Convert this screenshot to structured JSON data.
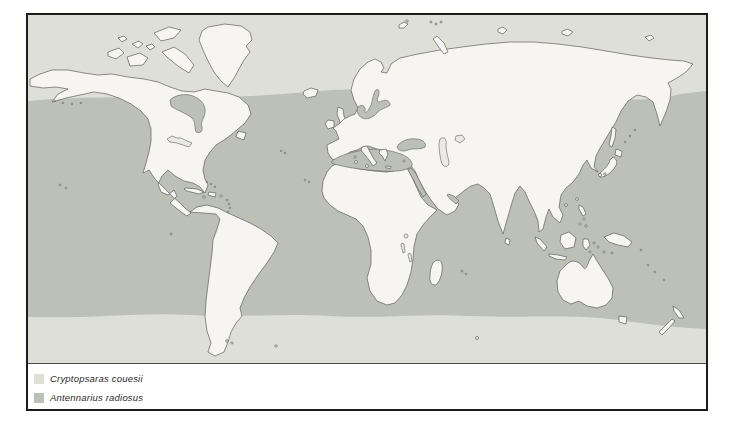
{
  "figure": {
    "legend": {
      "items": [
        {
          "id": "cryptopsaras-couesii",
          "label": "Cryptopsaras couesii",
          "color": "#dee0d8"
        },
        {
          "id": "antennarius-radiosus",
          "label": "Antennarius radiosus",
          "color": "#bcc0b7"
        }
      ]
    },
    "colors": {
      "range_light": "#dee0d8",
      "range_dark": "#bcc0b7",
      "land": "#f6f5f1",
      "coastline": "#5f5f5c",
      "frame": "#1c1c1c",
      "background": "#ffffff"
    }
  }
}
